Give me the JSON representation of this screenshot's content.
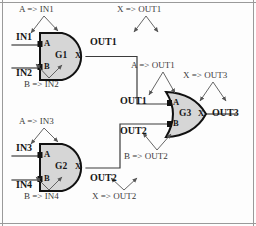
{
  "diagram": {
    "type": "logic-circuit",
    "colors": {
      "wire": "#3c3c3c",
      "gate_fill": "#d6d6d6",
      "gate_stroke": "#111111",
      "annotation": "#555555",
      "text": "#171717",
      "border": "#9a9a9a",
      "background": "#fdfdfd"
    }
  },
  "gates": [
    {
      "id": "g1",
      "name": "G1",
      "kind": "AND",
      "input_a": "A",
      "input_b": "B",
      "output": "X"
    },
    {
      "id": "g2",
      "name": "G2",
      "kind": "AND",
      "input_a": "A",
      "input_b": "B",
      "output": "X"
    },
    {
      "id": "g3",
      "name": "G3",
      "kind": "OR",
      "input_a": "A",
      "input_b": "B",
      "output": "X"
    }
  ],
  "signals": {
    "in1": "IN1",
    "in2": "IN2",
    "in3": "IN3",
    "in4": "IN4",
    "out1_g1": "OUT1",
    "out2_g2": "OUT2",
    "out1_g3": "OUT1",
    "out2_g3": "OUT2",
    "out3": "OUT3"
  },
  "annotations": [
    {
      "id": "a-in1",
      "text": "A => IN1"
    },
    {
      "id": "b-in2",
      "text": "B => IN2"
    },
    {
      "id": "x-out1",
      "text": "X => OUT1"
    },
    {
      "id": "a-in3",
      "text": "A => IN3"
    },
    {
      "id": "b-in4",
      "text": "B => IN4"
    },
    {
      "id": "x-out2",
      "text": "X => OUT2"
    },
    {
      "id": "a-out1",
      "text": "A => OUT1"
    },
    {
      "id": "b-out2",
      "text": "B => OUT2"
    },
    {
      "id": "x-out3",
      "text": "X => OUT3"
    }
  ]
}
